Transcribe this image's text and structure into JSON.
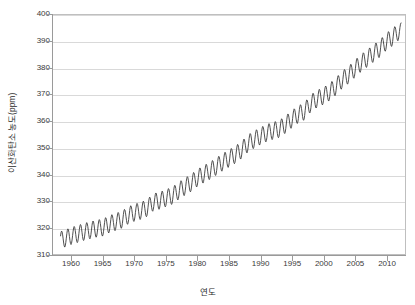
{
  "chart_data": {
    "type": "line",
    "title": "",
    "subtitle": "",
    "xlabel": "연도",
    "ylabel": "이산화탄소 농도(ppm)",
    "xlim": [
      1957,
      2013
    ],
    "ylim": [
      310,
      400
    ],
    "xticks": [
      1960,
      1965,
      1970,
      1975,
      1980,
      1985,
      1990,
      1995,
      2000,
      2005,
      2010
    ],
    "yticks": [
      310,
      320,
      330,
      340,
      350,
      360,
      370,
      380,
      390,
      400
    ],
    "grid": "horizontal",
    "legend": "none",
    "series_color": "#3a3a3a",
    "grid_color": "#d9d9d9",
    "axis_color": "#9a9a9a",
    "annotations": [],
    "series": [
      {
        "name": "이산화탄소 농도",
        "seasonal_amplitude_ppm": 3.2,
        "x": [
          1958.2,
          1959.0,
          1960.0,
          1961.0,
          1962.0,
          1963.0,
          1964.0,
          1965.0,
          1966.0,
          1967.0,
          1968.0,
          1969.0,
          1970.0,
          1971.0,
          1972.0,
          1973.0,
          1974.0,
          1975.0,
          1976.0,
          1977.0,
          1978.0,
          1979.0,
          1980.0,
          1981.0,
          1982.0,
          1983.0,
          1984.0,
          1985.0,
          1986.0,
          1987.0,
          1988.0,
          1989.0,
          1990.0,
          1991.0,
          1992.0,
          1993.0,
          1994.0,
          1995.0,
          1996.0,
          1997.0,
          1998.0,
          1999.0,
          2000.0,
          2001.0,
          2002.0,
          2003.0,
          2004.0,
          2005.0,
          2006.0,
          2007.0,
          2008.0,
          2009.0,
          2010.0,
          2011.0,
          2012.0
        ],
        "values": [
          315.3,
          315.9,
          316.9,
          317.6,
          318.4,
          319.0,
          319.6,
          320.0,
          321.3,
          322.1,
          323.0,
          324.6,
          325.6,
          326.3,
          327.4,
          329.6,
          330.1,
          331.1,
          332.0,
          333.8,
          335.4,
          336.8,
          338.7,
          340.1,
          341.4,
          343.0,
          344.6,
          346.0,
          347.4,
          349.2,
          351.6,
          353.1,
          354.4,
          355.6,
          356.4,
          357.1,
          358.8,
          360.8,
          362.6,
          363.7,
          366.7,
          368.4,
          369.5,
          371.0,
          373.1,
          375.6,
          377.4,
          379.7,
          381.9,
          383.7,
          385.6,
          387.4,
          389.9,
          391.6,
          393.8
        ]
      }
    ]
  },
  "axis": {
    "ylabel": "이산화탄소 농도(ppm)",
    "xlabel": "연도"
  }
}
